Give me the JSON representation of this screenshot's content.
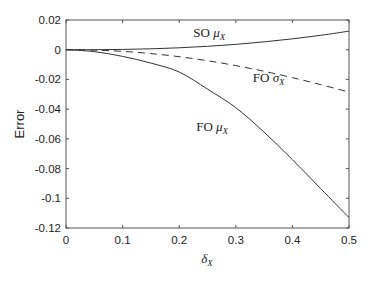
{
  "chart_data": {
    "type": "line",
    "title": "",
    "xlabel": "δX",
    "ylabel": "Error",
    "xlim": [
      0,
      0.5
    ],
    "ylim": [
      -0.12,
      0.02
    ],
    "grid": false,
    "legend": "inline annotations",
    "x_ticks": [
      "0",
      "0.1",
      "0.2",
      "0.3",
      "0.4",
      "0.5"
    ],
    "y_ticks": [
      "0.02",
      "0",
      "-0.02",
      "-0.04",
      "-0.06",
      "-0.08",
      "-0.1",
      "-0.12"
    ],
    "x": [
      0,
      0.05,
      0.1,
      0.15,
      0.2,
      0.25,
      0.3,
      0.35,
      0.4,
      0.45,
      0.5
    ],
    "series": [
      {
        "name": "SO μX",
        "style": "solid",
        "values": [
          0,
          0.0,
          0.0002,
          0.0006,
          0.0013,
          0.0023,
          0.0036,
          0.0053,
          0.0073,
          0.0097,
          0.0125
        ]
      },
      {
        "name": "FO σX",
        "style": "dashed",
        "values": [
          0,
          -0.0003,
          -0.0011,
          -0.0026,
          -0.0047,
          -0.0074,
          -0.0107,
          -0.0145,
          -0.0188,
          -0.0235,
          -0.0285
        ]
      },
      {
        "name": "FO μX",
        "style": "solid",
        "values": [
          0,
          -0.0013,
          -0.0045,
          -0.009,
          -0.015,
          -0.0265,
          -0.039,
          -0.0555,
          -0.074,
          -0.0935,
          -0.113
        ]
      }
    ],
    "annotations": [
      {
        "text": "SO",
        "sub": "μ",
        "subscript": "X",
        "x": 0.225,
        "y": 0.0085
      },
      {
        "text": "FO",
        "sub": "σ",
        "subscript": "X",
        "x": 0.33,
        "y": -0.0215
      },
      {
        "text": "FO",
        "sub": "μ",
        "subscript": "X",
        "x": 0.23,
        "y": -0.055
      }
    ]
  }
}
